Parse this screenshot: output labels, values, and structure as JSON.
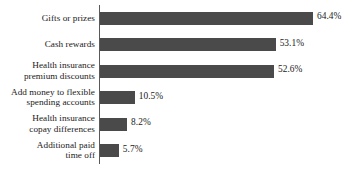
{
  "chart_data": {
    "type": "bar",
    "orientation": "horizontal",
    "title": "",
    "subtitle": "",
    "xlabel": "",
    "ylabel": "",
    "grid": false,
    "legend": false,
    "axis_line": "vertical category axis at left of bars",
    "xlim": [
      0,
      64.4
    ],
    "categories": [
      "Gifts or prizes",
      "Cash rewards",
      "Health insurance\npremium discounts",
      "Add money to flexible\nspending accounts",
      "Health insurance\ncopay differences",
      "Additional paid\ntime off"
    ],
    "values": [
      64.4,
      53.1,
      52.6,
      10.5,
      8.2,
      5.7
    ],
    "value_labels": [
      "64.4%",
      "53.1%",
      "52.6%",
      "10.5%",
      "8.2%",
      "5.7%"
    ],
    "bar_color": "#4a4a4a",
    "background_color": "#ffffff",
    "text_color": "#1a1a1a"
  },
  "bars": [
    {
      "label": "Gifts or prizes",
      "lines": 1,
      "value": 64.4,
      "value_label": "64.4%"
    },
    {
      "label": "Cash rewards",
      "lines": 1,
      "value": 53.1,
      "value_label": "53.1%"
    },
    {
      "label": "Health insurance\npremium discounts",
      "lines": 2,
      "value": 52.6,
      "value_label": "52.6%"
    },
    {
      "label": "Add money to flexible\nspending accounts",
      "lines": 2,
      "value": 10.5,
      "value_label": "10.5%"
    },
    {
      "label": "Health insurance\ncopay differences",
      "lines": 2,
      "value": 8.2,
      "value_label": "8.2%"
    },
    {
      "label": "Additional paid\ntime off",
      "lines": 2,
      "value": 5.7,
      "value_label": "5.7%"
    }
  ]
}
